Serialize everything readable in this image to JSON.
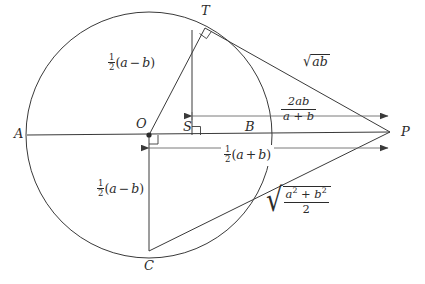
{
  "figure": {
    "background_color": "#ffffff",
    "stroke_color": "#3a3a3a",
    "text_color": "#2b2b2b"
  },
  "points": [
    {
      "id": "A",
      "label": "A",
      "x": 27,
      "y": 135,
      "label_x": 14,
      "label_y": 128,
      "role": "circle-left-endpoint"
    },
    {
      "id": "O",
      "label": "O",
      "x": 149,
      "y": 135,
      "label_x": 137,
      "label_y": 119,
      "role": "circle-center"
    },
    {
      "id": "S",
      "label": "S",
      "x": 192,
      "y": 135,
      "label_x": 184,
      "label_y": 121,
      "role": "foot-of-perpendicular"
    },
    {
      "id": "B",
      "label": "B",
      "x": 253,
      "y": 135,
      "label_x": 246,
      "label_y": 121,
      "role": "circle-right-endpoint"
    },
    {
      "id": "P",
      "label": "P",
      "x": 390,
      "y": 132,
      "label_x": 400,
      "label_y": 126,
      "role": "external-point"
    },
    {
      "id": "T",
      "label": "T",
      "x": 205,
      "y": 28,
      "label_x": 201,
      "label_y": 6,
      "role": "tangent-point"
    },
    {
      "id": "C",
      "label": "C",
      "x": 149,
      "y": 251,
      "label_x": 144,
      "label_y": 258,
      "role": "circle-bottom"
    }
  ],
  "circle": {
    "cx": 149,
    "cy": 135,
    "r": 123
  },
  "labels": {
    "radius_upper": {
      "name": "half-a-minus-b-upper",
      "text": "½(a − b)",
      "parts": {
        "numerator": "1",
        "denominator": "2",
        "open": "(",
        "first": "a",
        "operator": "−",
        "second": "b",
        "close": ")"
      },
      "x": 108,
      "y": 60,
      "describes": "segment OT, radius of the circle"
    },
    "radius_lower": {
      "name": "half-a-minus-b-lower",
      "text": "½(a − b)",
      "parts": {
        "numerator": "1",
        "denominator": "2",
        "open": "(",
        "first": "a",
        "operator": "−",
        "second": "b",
        "close": ")"
      },
      "x": 97,
      "y": 186,
      "describes": "segment OC, radius of the circle"
    },
    "geometric_mean": {
      "name": "sqrt-ab",
      "text": "√(ab)",
      "parts": {
        "radicand": "ab"
      },
      "x": 303,
      "y": 60,
      "describes": "tangent length TP, the geometric mean"
    },
    "harmonic_mean": {
      "name": "two-ab-over-a-plus-b",
      "text": "2ab/(a+b)",
      "parts": {
        "numerator": "2ab",
        "denominator": "a + b"
      },
      "x": 281,
      "y": 105,
      "describes": "segment SP, the harmonic mean"
    },
    "arithmetic_mean": {
      "name": "half-a-plus-b",
      "text": "½(a + b)",
      "parts": {
        "numerator": "1",
        "denominator": "2",
        "open": "(",
        "first": "a",
        "operator": "+",
        "second": "b",
        "close": ")"
      },
      "x": 221,
      "y": 152,
      "describes": "segment OP, the arithmetic mean"
    },
    "quadratic_mean": {
      "name": "sqrt-a-squared-plus-b-squared-over-two",
      "text": "√((a² + b²)/2)",
      "parts": {
        "numerator": "a² + b²",
        "denominator": "2"
      },
      "x": 266,
      "y": 193,
      "describes": "segment CP, the quadratic mean"
    }
  },
  "segments": [
    {
      "name": "diameter-AP",
      "from": "A",
      "to": "P"
    },
    {
      "name": "radius-OT",
      "from": "O",
      "to": "T"
    },
    {
      "name": "tangent-TP",
      "from": "T",
      "to": "P"
    },
    {
      "name": "altitude-TS",
      "from": "T",
      "to": "S"
    },
    {
      "name": "radius-OC",
      "from": "O",
      "to": "C"
    },
    {
      "name": "chord-CP",
      "from": "C",
      "to": "P"
    }
  ],
  "dimension_arrows": [
    {
      "name": "harmonic-mean-arrow",
      "from_x": 192,
      "to_x": 388,
      "y": 116,
      "heads": "both"
    },
    {
      "name": "arithmetic-mean-arrow",
      "from_x": 149,
      "to_x": 388,
      "y": 148,
      "heads": "both"
    }
  ],
  "right_angle_marks": [
    {
      "name": "right-angle-at-T",
      "at": "T",
      "between": "OT and TP"
    },
    {
      "name": "right-angle-at-S",
      "at": "S",
      "between": "TS and axis"
    },
    {
      "name": "right-angle-at-O",
      "at": "O",
      "between": "OC and axis"
    }
  ]
}
